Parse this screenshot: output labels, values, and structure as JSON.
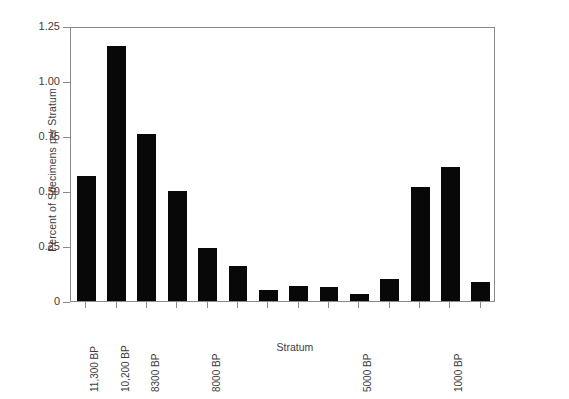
{
  "chart_data": {
    "type": "bar",
    "title": "",
    "subtitle": "",
    "xlabel": "Stratum",
    "ylabel": "Percent of Specimens per Stratum",
    "categories": [
      "I",
      "II",
      "III",
      "IV",
      "V",
      "VI",
      "VII",
      "VIII",
      "IX",
      "XI",
      "XII",
      "XVI",
      "XVII",
      "XVIII"
    ],
    "values": [
      0.57,
      1.16,
      0.76,
      0.5,
      0.24,
      0.16,
      0.05,
      0.07,
      0.065,
      0.03,
      0.1,
      0.52,
      0.61,
      0.085
    ],
    "ylim": [
      0,
      1.25
    ],
    "ytick_labels": [
      "1.25",
      "1.00",
      "0.75",
      "0.50",
      "0.25",
      "0"
    ],
    "ytick_values": [
      1.25,
      1.0,
      0.75,
      0.5,
      0.25,
      0
    ],
    "grid": false,
    "legend": false,
    "legend_position": "none",
    "bar_color": "#080808",
    "axis_color": "#8a8a8a",
    "text_color": "#3d3d3d",
    "background_color": "#ffffff",
    "annotations": [
      {
        "category": "I",
        "text": "11,300 BP"
      },
      {
        "category": "II",
        "text": "10,200 BP"
      },
      {
        "category": "III",
        "text": "8300 BP"
      },
      {
        "category": "V",
        "text": "8000 BP"
      },
      {
        "category": "XI",
        "text": "5000 BP"
      },
      {
        "category": "XVII",
        "text": "1000 BP"
      }
    ]
  }
}
